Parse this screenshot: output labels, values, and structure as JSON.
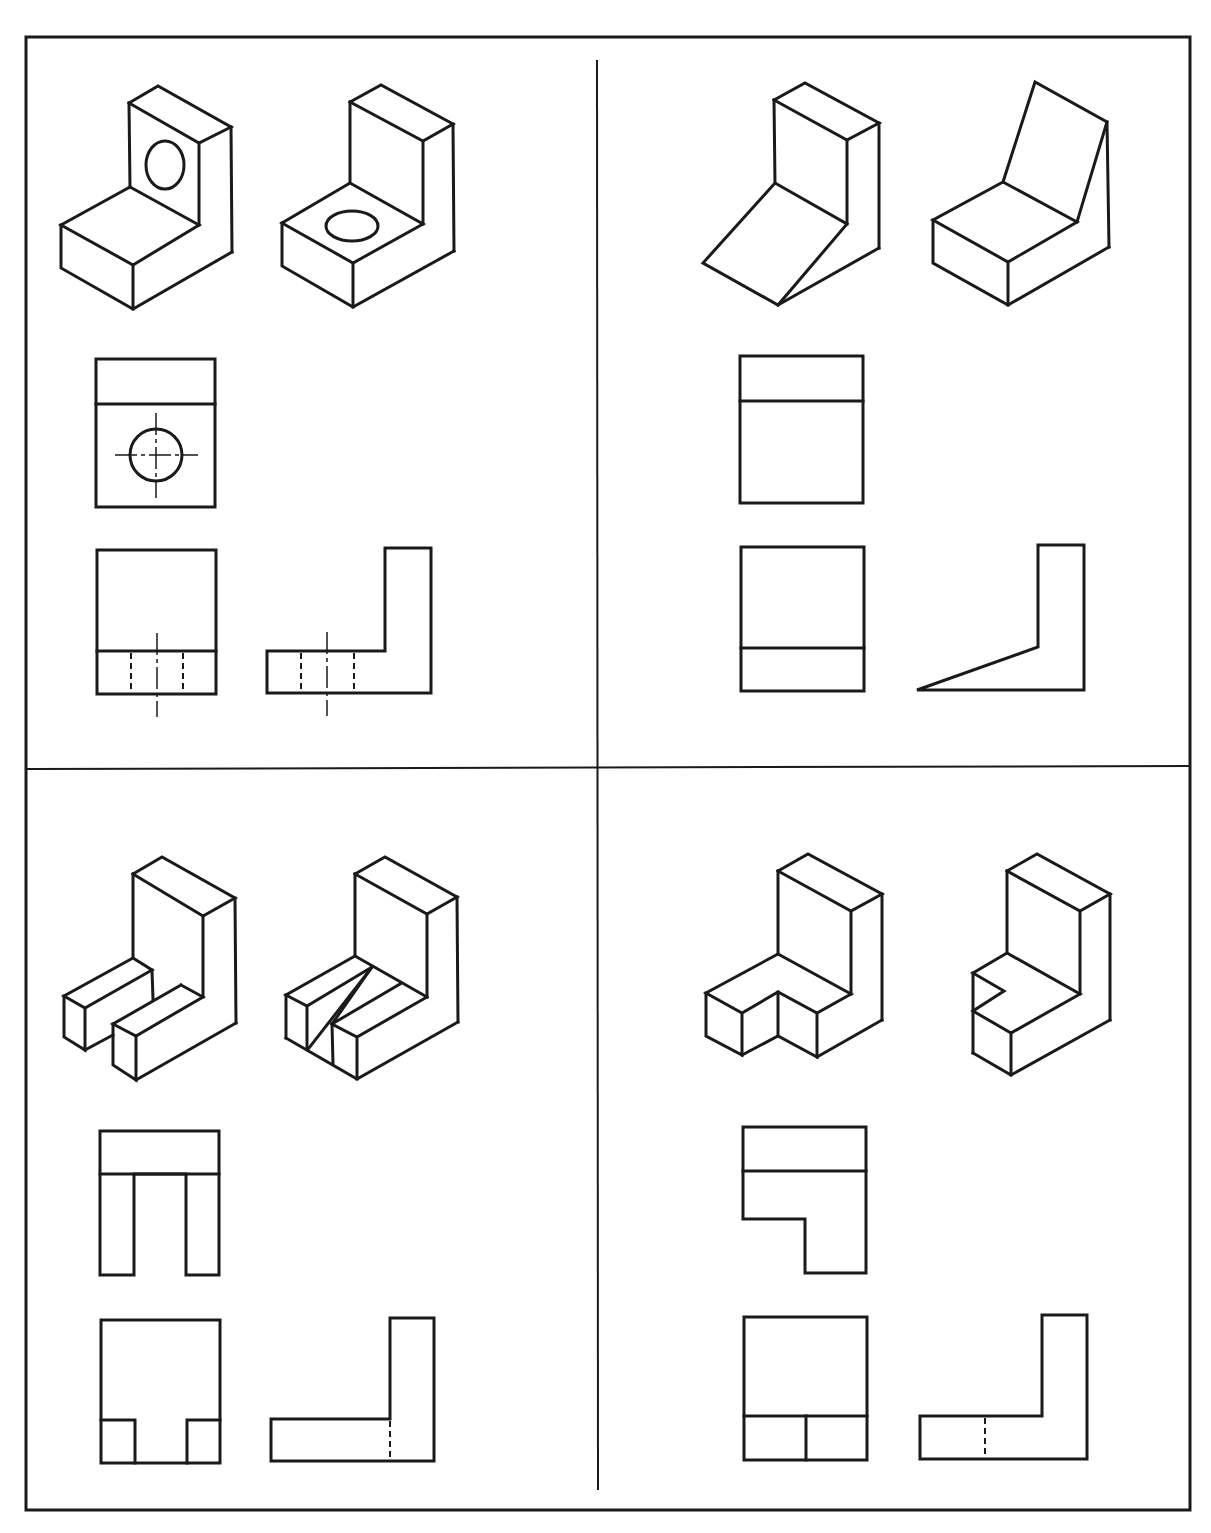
{
  "page": {
    "top_cut_text": "",
    "layout": "2x2 grid of orthographic projection exercises",
    "line_color": "#1a1a1a",
    "background": "#ffffff"
  },
  "panels": [
    {
      "id": "panel-1",
      "position": "top-left",
      "isometric_views": [
        "L-bracket with hole through vertical face",
        "L-bracket with hole through horizontal base"
      ],
      "orthographic_views": [
        "top view with circle and centerlines",
        "front view with hidden hole lines",
        "side view L-profile with hidden hole lines"
      ]
    },
    {
      "id": "panel-2",
      "position": "top-right",
      "isometric_views": [
        "L-bracket with sloped base",
        "L-bracket with sloped back"
      ],
      "orthographic_views": [
        "top view",
        "front view",
        "side view with sloped base"
      ]
    },
    {
      "id": "panel-3",
      "position": "bottom-left",
      "isometric_views": [
        "L-bracket with slotted base",
        "L-bracket with angled slot"
      ],
      "orthographic_views": [
        "top view with slot",
        "front view with slot",
        "side view with hidden line"
      ]
    },
    {
      "id": "panel-4",
      "position": "bottom-right",
      "isometric_views": [
        "L-bracket with corner notch (front)",
        "L-bracket with corner notch (side)"
      ],
      "orthographic_views": [
        "top view with notch",
        "front view with split base",
        "side view with hidden line"
      ]
    }
  ]
}
